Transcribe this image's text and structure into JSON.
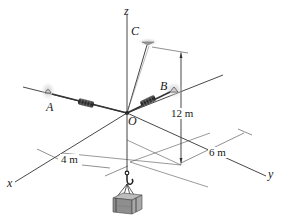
{
  "figure": {
    "type": "3D statics diagram",
    "axes": {
      "x": "x",
      "y": "y",
      "z": "z"
    },
    "points": {
      "A": "A",
      "B": "B",
      "C": "C",
      "O": "O"
    },
    "dimensions": {
      "height": "12 m",
      "x_offset": "4 m",
      "y_offset": "6 m"
    },
    "components": [
      "spring OA",
      "spring OB",
      "cable OC",
      "hook",
      "crate load"
    ],
    "colors": {
      "line": "#333333",
      "spring": "#3a3a3a",
      "support_glow": "#bdbdbd",
      "crate": "#9a9a9a"
    }
  }
}
